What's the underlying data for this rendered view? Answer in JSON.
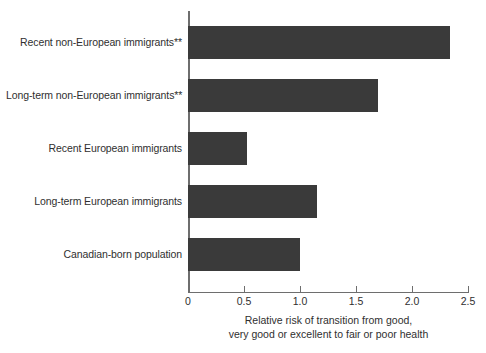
{
  "chart_data": {
    "type": "bar",
    "orientation": "horizontal",
    "title": "",
    "xlabel": "Relative risk of transition from good, very good or excellent to fair or poor health",
    "xlabel_lines": [
      "Relative risk of transition from good,",
      "very good or excellent to fair or poor health"
    ],
    "ylabel": "",
    "categories": [
      "Recent non-European immigrants**",
      "Long-term non-European immigrants**",
      "Recent European immigrants",
      "Long-term European immigrants",
      "Canadian-born population"
    ],
    "values": [
      2.34,
      1.7,
      0.53,
      1.15,
      1.0
    ],
    "xlim": [
      0,
      2.5
    ],
    "xticks": [
      0,
      0.5,
      1.0,
      1.5,
      2.0,
      2.5
    ],
    "xticklabels": [
      "0",
      "0.5",
      "1.0",
      "1.5",
      "2.0",
      "2.5"
    ],
    "grid": false,
    "legend": false,
    "bar_color": "#3a3a3a",
    "axis_color": "#6e6e6e",
    "background": "#ffffff"
  }
}
